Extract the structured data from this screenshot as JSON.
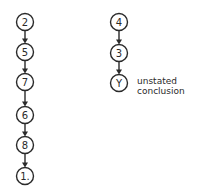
{
  "diagram": {
    "type": "argument-structure",
    "columns": [
      {
        "id": "left",
        "nodes": [
          {
            "label": "2",
            "cx": 25,
            "cy": 22
          },
          {
            "label": "5",
            "cx": 25,
            "cy": 52
          },
          {
            "label": "7",
            "cx": 25,
            "cy": 82
          },
          {
            "label": "6",
            "cx": 25,
            "cy": 115
          },
          {
            "label": "8",
            "cx": 25,
            "cy": 145
          },
          {
            "label": "1.",
            "cx": 25,
            "cy": 176
          }
        ]
      },
      {
        "id": "right",
        "nodes": [
          {
            "label": "4",
            "cx": 119,
            "cy": 22
          },
          {
            "label": "3",
            "cx": 119,
            "cy": 53
          },
          {
            "label": "Y",
            "cx": 119,
            "cy": 83
          }
        ]
      }
    ],
    "annotation": {
      "line1": "unstated",
      "line2": "conclusion"
    },
    "colors": {
      "stroke": "#2a2a2a",
      "background": "#ffffff"
    }
  }
}
